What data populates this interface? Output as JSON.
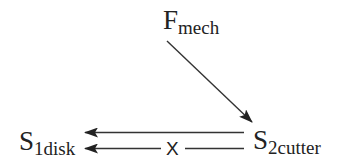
{
  "diagram": {
    "nodes": {
      "fmech": {
        "main": "F",
        "sub": "mech"
      },
      "s1disk": {
        "main": "S",
        "sub": "1disk"
      },
      "s2cutter": {
        "main": "S",
        "sub": "2cutter"
      }
    },
    "edges": [
      {
        "from": "F_mech",
        "to": "S_2cutter",
        "style": "arrow"
      },
      {
        "from": "S_2cutter",
        "to": "S_1disk",
        "style": "arrow"
      },
      {
        "from": "S_2cutter",
        "to": "S_1disk",
        "style": "arrow-blocked",
        "marker": "X"
      }
    ],
    "block_marker": "X",
    "colors": {
      "stroke": "#333333",
      "text": "#222222"
    }
  }
}
